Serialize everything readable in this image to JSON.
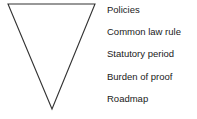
{
  "diagram": {
    "type": "inverted-pyramid",
    "shape": {
      "top_left": [
        8,
        4
      ],
      "top_right": [
        95,
        4
      ],
      "apex": [
        52,
        109
      ],
      "stroke_color": "#333333"
    },
    "labels": [
      "Policies",
      "Common law rule",
      "Statutory period",
      "Burden of proof",
      "Roadmap"
    ]
  }
}
